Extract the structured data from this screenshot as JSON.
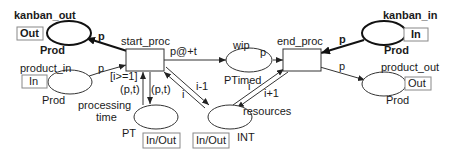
{
  "places": {
    "kanban_out": {
      "name": "kanban_out",
      "type": "Prod",
      "port": "Out"
    },
    "product_in": {
      "name": "product_in",
      "type": "Prod",
      "port": "In"
    },
    "wip": {
      "name": "wip",
      "type": "PTimed"
    },
    "kanban_in": {
      "name": "kanban_in",
      "type": "Prod",
      "port": "In"
    },
    "product_out": {
      "name": "product_out",
      "type": "Prod",
      "port": "Out"
    },
    "processing_time": {
      "name_line1": "processing",
      "name_line2": "time",
      "type": "PT",
      "port": "In/Out"
    },
    "resources": {
      "name": "resources",
      "type": "INT",
      "port": "In/Out"
    }
  },
  "transitions": {
    "start_proc": {
      "name": "start_proc",
      "guard": "[i>=1]"
    },
    "end_proc": {
      "name": "end_proc"
    }
  },
  "arcs": {
    "start_to_kanban_out": "p",
    "product_in_to_start": "p",
    "start_to_wip": "p@+t",
    "wip_to_end": "p",
    "kanban_in_to_end": "p",
    "end_to_product_out": "p",
    "pt_to_start": "(p,t)",
    "start_to_pt": "(p,t)",
    "resources_to_start": "i",
    "start_to_resources": "i-1",
    "resources_to_end": "i",
    "end_to_resources": "i+1"
  }
}
